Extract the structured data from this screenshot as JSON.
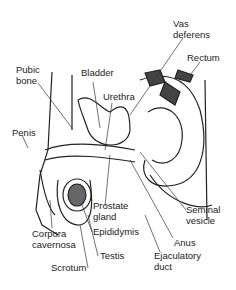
{
  "diagram": {
    "labels": [
      {
        "id": "vas-deferens",
        "lines": [
          "Vas",
          "deferens"
        ]
      },
      {
        "id": "rectum",
        "lines": [
          "Rectum"
        ]
      },
      {
        "id": "pubic-bone",
        "lines": [
          "Pubic",
          "bone"
        ]
      },
      {
        "id": "bladder",
        "lines": [
          "Bladder"
        ]
      },
      {
        "id": "urethra",
        "lines": [
          "Urethra"
        ]
      },
      {
        "id": "penis",
        "lines": [
          "Penis"
        ]
      },
      {
        "id": "prostate-gland",
        "lines": [
          "Prostate",
          "gland"
        ]
      },
      {
        "id": "seminal-vesicle",
        "lines": [
          "Seminal",
          "vesicle"
        ]
      },
      {
        "id": "epididymis",
        "lines": [
          "Epididymis"
        ]
      },
      {
        "id": "corpora-cavernosa",
        "lines": [
          "Corpora",
          "cavernosa"
        ]
      },
      {
        "id": "anus",
        "lines": [
          "Anus"
        ]
      },
      {
        "id": "testis",
        "lines": [
          "Testis"
        ]
      },
      {
        "id": "ejaculatory-duct",
        "lines": [
          "Ejaculatory",
          "duct"
        ]
      },
      {
        "id": "scrotum",
        "lines": [
          "Scrotum"
        ]
      }
    ]
  }
}
